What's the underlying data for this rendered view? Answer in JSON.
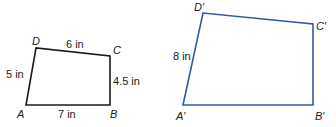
{
  "figures": [
    {
      "name": "original-quadrilateral",
      "stroke": "#1a1a1a",
      "vertices": {
        "A": {
          "label": "A",
          "x": 26,
          "y": 105
        },
        "B": {
          "label": "B",
          "x": 110,
          "y": 105
        },
        "C": {
          "label": "C",
          "x": 110,
          "y": 56
        },
        "D": {
          "label": "D",
          "x": 36,
          "y": 48
        }
      },
      "sides": {
        "DC": "6 in",
        "DA": "5 in",
        "CB": "4.5 in",
        "AB": "7 in"
      }
    },
    {
      "name": "scaled-quadrilateral",
      "stroke": "#2f5aa8",
      "vertices": {
        "A": {
          "label": "A′",
          "x": 183,
          "y": 105
        },
        "B": {
          "label": "B′",
          "x": 313,
          "y": 105
        },
        "C": {
          "label": "C′",
          "x": 313,
          "y": 24
        },
        "D": {
          "label": "D′",
          "x": 203,
          "y": 13
        }
      },
      "sides": {
        "DA": "8 in"
      }
    }
  ]
}
